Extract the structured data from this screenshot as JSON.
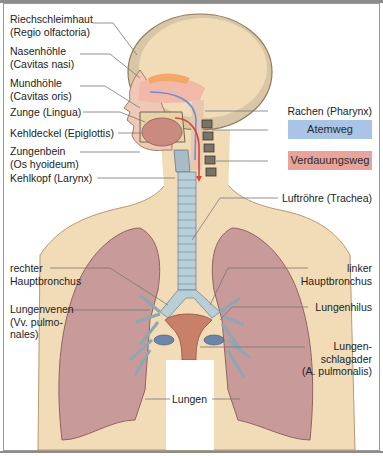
{
  "figure": {
    "labels_left": [
      {
        "id": "riechschleimhaut",
        "line1": "Riechschleimhaut",
        "line2": "(Regio olfactoria)"
      },
      {
        "id": "nasenhoehle",
        "line1": "Nasenhöhle",
        "line2": "(Cavitas nasi)"
      },
      {
        "id": "mundhoehle",
        "line1": "Mundhöhle",
        "line2": "(Cavitas oris)"
      },
      {
        "id": "zunge",
        "line1": "Zunge (Lingua)"
      },
      {
        "id": "kehldeckel",
        "line1": "Kehldeckel (Epiglottis)"
      },
      {
        "id": "zungenbein",
        "line1": "Zungenbein",
        "line2": "(Os hyoideum)"
      },
      {
        "id": "kehlkopf",
        "line1": "Kehlkopf (Larynx)"
      },
      {
        "id": "rechter_hauptbronchus",
        "line1": "rechter",
        "line2": "Hauptbronchus"
      },
      {
        "id": "lungenvenen",
        "line1": "Lungenvenen",
        "line2": "(Vv. pulmo-",
        "line3": "nales)"
      }
    ],
    "labels_right": [
      {
        "id": "rachen",
        "line1": "Rachen (Pharynx)"
      },
      {
        "id": "luftroehre",
        "line1": "Luftröhre (Trachea)"
      },
      {
        "id": "linker_hauptbronchus",
        "line1": "linker",
        "line2": "Hauptbronchus"
      },
      {
        "id": "lungenhilus",
        "line1": "Lungenhilus"
      },
      {
        "id": "lungenschlagader",
        "line1": "Lungen-",
        "line2": "schlagader",
        "line3": "(A. pulmonalis)"
      }
    ],
    "labels_center": [
      {
        "id": "lungen",
        "line1": "Lungen"
      }
    ],
    "legend": [
      {
        "label": "Atemweg",
        "color": "#a9c4e4"
      },
      {
        "label": "Verdauungsweg",
        "color": "#e8a39b"
      }
    ],
    "colors": {
      "skin": "#f2dcb8",
      "lung": "#c99a9a",
      "trachea": "#b9cfd8",
      "airflow_arrow": "#6f8fd0",
      "food_arrow": "#d9453a"
    }
  }
}
